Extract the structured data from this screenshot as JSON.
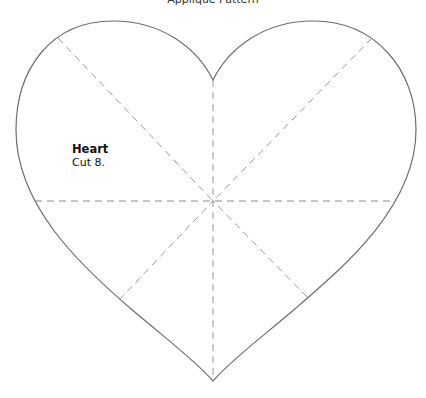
{
  "page": {
    "title": "Applique Pattern"
  },
  "pattern": {
    "shape": "heart",
    "name": "Heart",
    "instruction": "Cut 8.",
    "outline_color": "#6e6e6e",
    "guide_line_color": "#9a9a9a",
    "guide_line_style": "dashed",
    "guide_lines": [
      {
        "name": "vertical-center",
        "x1": 213,
        "y1": 80,
        "x2": 213,
        "y2": 381
      },
      {
        "name": "horizontal-center",
        "x1": 35,
        "y1": 201,
        "x2": 395,
        "y2": 201
      },
      {
        "name": "diagonal-upper-left",
        "x1": 58,
        "y1": 38,
        "x2": 213,
        "y2": 201
      },
      {
        "name": "diagonal-upper-right",
        "x1": 372,
        "y1": 38,
        "x2": 213,
        "y2": 201
      },
      {
        "name": "diagonal-lower-left",
        "x1": 119,
        "y1": 300,
        "x2": 213,
        "y2": 201
      },
      {
        "name": "diagonal-lower-right",
        "x1": 307,
        "y1": 297,
        "x2": 213,
        "y2": 201
      }
    ],
    "center": {
      "x": 213,
      "y": 201
    }
  }
}
